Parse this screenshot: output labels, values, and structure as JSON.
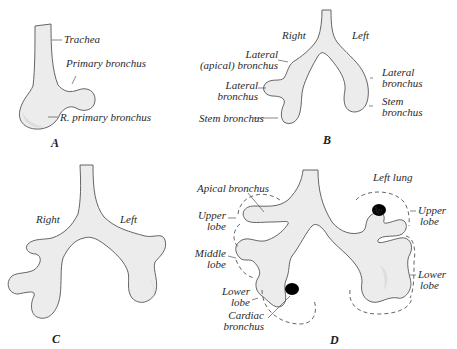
{
  "figure": {
    "panels": [
      {
        "id": "A",
        "label": "A",
        "annotations": {
          "trachea": "Trachea",
          "primary_bronchus": "Primary bronchus",
          "r_primary_bronchus": "R. primary bronchus"
        }
      },
      {
        "id": "B",
        "label": "B",
        "annotations": {
          "right": "Right",
          "left": "Left",
          "lateral_apical_1": "Lateral",
          "lateral_apical_2": "(apical) bronchus",
          "lateral_r_1": "Lateral",
          "lateral_r_2": "bronchus",
          "stem_r": "Stem bronchus",
          "lateral_l_1": "Lateral",
          "lateral_l_2": "bronchus",
          "stem_l_1": "Stem",
          "stem_l_2": "bronchus"
        }
      },
      {
        "id": "C",
        "label": "C",
        "annotations": {
          "right": "Right",
          "left": "Left"
        }
      },
      {
        "id": "D",
        "label": "D",
        "annotations": {
          "apical_bronchus": "Apical bronchus",
          "upper_lobe_r_1": "Upper",
          "upper_lobe_r_2": "lobe",
          "middle_lobe_1": "Middle",
          "middle_lobe_2": "lobe",
          "lower_lobe_r_1": "Lower",
          "lower_lobe_r_2": "lobe",
          "cardiac_1": "Cardiac",
          "cardiac_2": "bronchus",
          "left_lung": "Left lung",
          "ap": "Ap",
          "upper_lobe_l_1": "Upper",
          "upper_lobe_l_2": "lobe",
          "lower_lobe_l_1": "Lower",
          "lower_lobe_l_2": "lobe"
        }
      }
    ]
  }
}
